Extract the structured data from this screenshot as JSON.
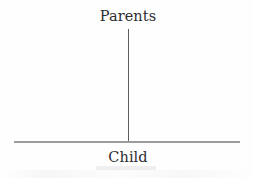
{
  "figure": {
    "type": "hierarchy-diagram",
    "background_color": "#fefefe",
    "nodes": {
      "top_label": "Parents",
      "bottom_label": "Child"
    },
    "connector": {
      "orientation": "vertical",
      "color": "#5b5b60"
    },
    "baseline": {
      "orientation": "horizontal",
      "color": "#9c9c9e"
    }
  },
  "chart_data": {
    "type": "diagram",
    "title": "",
    "categories": [
      "Parents",
      "Child"
    ],
    "annotations": [
      "Parents",
      "Child"
    ],
    "layout": "inverted-T: vertical stem from 'Parents' descending to a horizontal baseline labeled 'Child'"
  }
}
